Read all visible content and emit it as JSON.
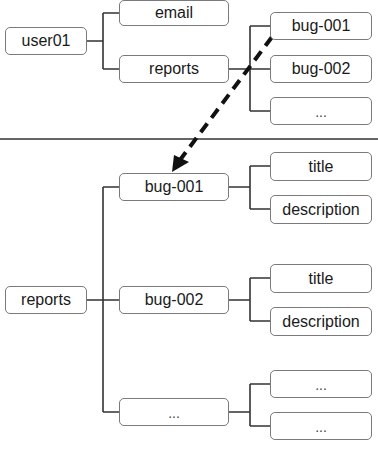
{
  "diagram": {
    "top_tree": {
      "root": {
        "label": "user01"
      },
      "children": [
        {
          "label": "email"
        },
        {
          "label": "reports",
          "children": [
            {
              "label": "bug-001"
            },
            {
              "label": "bug-002"
            },
            {
              "label": "..."
            }
          ]
        }
      ]
    },
    "bottom_tree": {
      "root": {
        "label": "reports"
      },
      "children": [
        {
          "label": "bug-001",
          "children": [
            {
              "label": "title"
            },
            {
              "label": "description"
            }
          ]
        },
        {
          "label": "bug-002",
          "children": [
            {
              "label": "title"
            },
            {
              "label": "description"
            }
          ]
        },
        {
          "label": "...",
          "children": [
            {
              "label": "..."
            },
            {
              "label": "..."
            }
          ]
        }
      ]
    },
    "arrow": {
      "from": "bug-001 (top tree)",
      "to": "bug-001 (bottom tree)",
      "style": "dashed"
    }
  }
}
